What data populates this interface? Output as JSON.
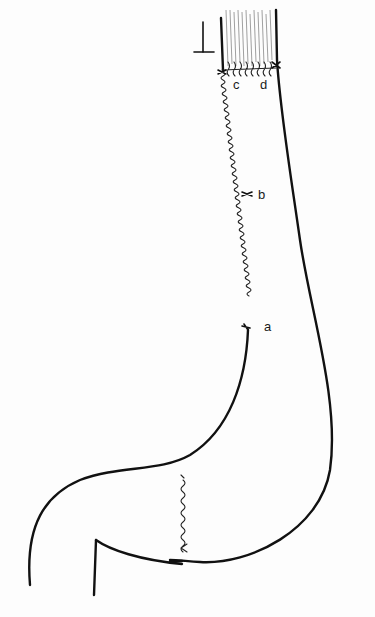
{
  "diagram": {
    "type": "surgical illustration",
    "labels": {
      "a": "a",
      "b": "b",
      "c": "c",
      "d": "d"
    },
    "markers": {
      "resection_margin_symbol": "T-mark (inverted)"
    },
    "colors": {
      "line": "#111111",
      "background": "#fdfdfd",
      "hatching": "#777777"
    }
  }
}
